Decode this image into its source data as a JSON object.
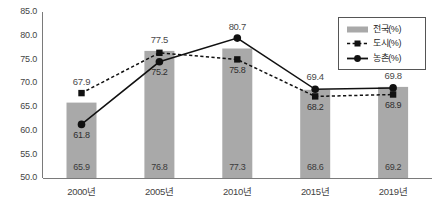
{
  "chart_data": {
    "type": "bar",
    "title": "",
    "subtitle": "",
    "xlabel": "",
    "ylabel": "",
    "categories": [
      "2000년",
      "2005년",
      "2010년",
      "2015년",
      "2019년"
    ],
    "ylim": [
      50.0,
      85.0
    ],
    "yticks": [
      "50.0",
      "55.0",
      "60.0",
      "65.0",
      "70.0",
      "75.0",
      "80.0",
      "85.0"
    ],
    "ytick_values": [
      50.0,
      55.0,
      60.0,
      65.0,
      70.0,
      75.0,
      80.0,
      85.0
    ],
    "grid": false,
    "legend_position": "top-right",
    "series": [
      {
        "name": "전국(%)",
        "kind": "bar",
        "color": "#a9a9a9",
        "values": [
          65.9,
          76.8,
          77.3,
          68.6,
          69.2
        ],
        "labels": [
          "65.9",
          "76.8",
          "77.3",
          "68.6",
          "69.2"
        ]
      },
      {
        "name": "도시(%)",
        "kind": "line",
        "style": "dotted",
        "marker": "square",
        "color": "#111111",
        "values": [
          67.9,
          76.4,
          75.0,
          67.2,
          67.6
        ],
        "labels": [
          "67.9",
          "77.5",
          "75.8",
          "68.2",
          "68.9"
        ]
      },
      {
        "name": "농촌(%)",
        "kind": "line",
        "style": "solid",
        "marker": "circle",
        "color": "#111111",
        "values": [
          61.3,
          74.5,
          79.5,
          68.7,
          69.0
        ],
        "labels": [
          "61.8",
          "75.2",
          "80.7",
          "69.4",
          "69.8"
        ]
      }
    ],
    "point_labels": {
      "outer": [
        "67.9",
        "77.5",
        "80.7",
        "69.4",
        "69.8"
      ],
      "inner": [
        "61.8",
        "75.2",
        "75.8",
        "68.2",
        "68.9"
      ],
      "bar_bottom": [
        "65.9",
        "76.8",
        "77.3",
        "68.6",
        "69.2"
      ]
    },
    "legend_entries": [
      "전국(%)",
      "도시(%)",
      "농촌(%)"
    ]
  }
}
